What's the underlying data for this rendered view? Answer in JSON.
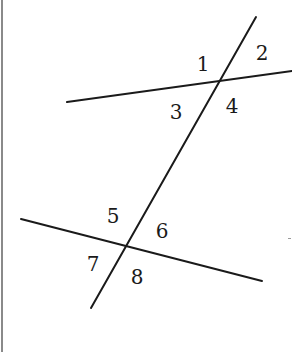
{
  "diagram": {
    "colors": {
      "line": "#1a1a1a",
      "label": "#1a1a1a",
      "border": "#8a8a8a",
      "background": "#ffffff"
    },
    "lines": {
      "transversal": {
        "x1": 256,
        "y1": 17,
        "x2": 91,
        "y2": 308
      },
      "upper_line": {
        "x1": 67,
        "y1": 102,
        "x2": 292,
        "y2": 71
      },
      "lower_line": {
        "x1": 21,
        "y1": 219,
        "x2": 262,
        "y2": 281
      }
    },
    "intersections": {
      "upper": {
        "x": 219,
        "y": 81
      },
      "lower": {
        "x": 126,
        "y": 246
      }
    },
    "angles": [
      {
        "label": "1",
        "x": 203,
        "y": 64
      },
      {
        "label": "2",
        "x": 262,
        "y": 53
      },
      {
        "label": "3",
        "x": 176,
        "y": 112
      },
      {
        "label": "4",
        "x": 232,
        "y": 106
      },
      {
        "label": "5",
        "x": 113,
        "y": 216
      },
      {
        "label": "6",
        "x": 162,
        "y": 231
      },
      {
        "label": "7",
        "x": 93,
        "y": 264
      },
      {
        "label": "8",
        "x": 137,
        "y": 277
      }
    ]
  }
}
